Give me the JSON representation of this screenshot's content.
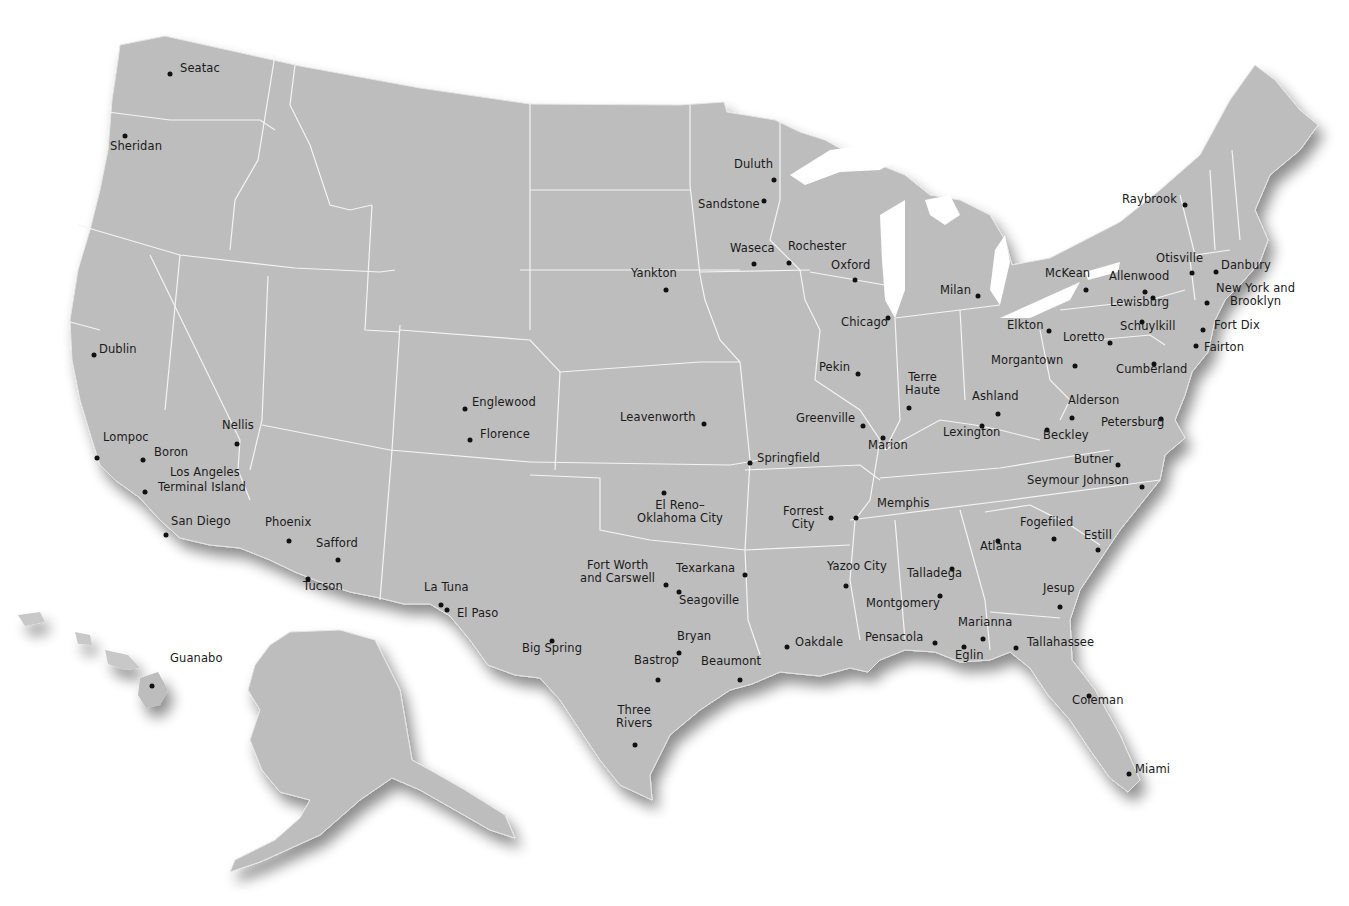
{
  "map": {
    "land_color": "#bdbdbd",
    "border_color": "#f2f2f2",
    "marker_color": "#111111",
    "label_color": "#1a1a1a",
    "background": "#ffffff"
  },
  "facilities": [
    {
      "name": "Seatac",
      "dot": [
        170,
        74
      ],
      "label": [
        180,
        68
      ]
    },
    {
      "name": "Sheridan",
      "dot": [
        125,
        136
      ],
      "label": [
        110,
        146
      ]
    },
    {
      "name": "Dublin",
      "dot": [
        94,
        355
      ],
      "label": [
        99,
        349
      ]
    },
    {
      "name": "Lompoc",
      "dot": [
        97,
        458
      ],
      "label": [
        103,
        437
      ]
    },
    {
      "name": "Boron",
      "dot": [
        143,
        460
      ],
      "label": [
        154,
        452
      ]
    },
    {
      "name": "Los Angeles",
      "dot": [
        145,
        492
      ],
      "label": [
        170,
        472
      ]
    },
    {
      "name": "Terminal Island",
      "dot": [
        145,
        492
      ],
      "label": [
        158,
        487
      ]
    },
    {
      "name": "Nellis",
      "dot": [
        237,
        444
      ],
      "label": [
        222,
        425
      ]
    },
    {
      "name": "San Diego",
      "dot": [
        166,
        535
      ],
      "label": [
        171,
        521
      ]
    },
    {
      "name": "Phoenix",
      "dot": [
        289,
        541
      ],
      "label": [
        265,
        522
      ]
    },
    {
      "name": "Safford",
      "dot": [
        338,
        560
      ],
      "label": [
        316,
        543
      ]
    },
    {
      "name": "Tucson",
      "dot": [
        308,
        579
      ],
      "label": [
        303,
        586
      ]
    },
    {
      "name": "Guanabo",
      "dot": [
        152,
        686
      ],
      "label": [
        170,
        658
      ]
    },
    {
      "name": "La Tuna",
      "dot": [
        441,
        605
      ],
      "label": [
        424,
        587
      ]
    },
    {
      "name": "El Paso",
      "dot": [
        447,
        610
      ],
      "label": [
        457,
        613
      ]
    },
    {
      "name": "Englewood",
      "dot": [
        465,
        409
      ],
      "label": [
        472,
        402
      ]
    },
    {
      "name": "Florence",
      "dot": [
        470,
        440
      ],
      "label": [
        480,
        434
      ]
    },
    {
      "name": "Leavenworth",
      "dot": [
        704,
        424
      ],
      "label": [
        620,
        417
      ]
    },
    {
      "name": "Springfield",
      "dot": [
        750,
        463
      ],
      "label": [
        757,
        458
      ]
    },
    {
      "name": "El Reno–Oklahoma City",
      "dot": [
        664,
        493
      ],
      "label": [
        637,
        505
      ]
    },
    {
      "name": "Fort Worth and Carswell",
      "dot": [
        666,
        585
      ],
      "label": [
        580,
        565
      ]
    },
    {
      "name": "Texarkana",
      "dot": [
        745,
        575
      ],
      "label": [
        676,
        568
      ]
    },
    {
      "name": "Seagoville",
      "dot": [
        679,
        592
      ],
      "label": [
        679,
        600
      ]
    },
    {
      "name": "Big Spring",
      "dot": [
        552,
        641
      ],
      "label": [
        522,
        648
      ]
    },
    {
      "name": "Bryan",
      "dot": [
        679,
        653
      ],
      "label": [
        677,
        636
      ]
    },
    {
      "name": "Bastrop",
      "dot": [
        658,
        680
      ],
      "label": [
        634,
        660
      ]
    },
    {
      "name": "Beaumont",
      "dot": [
        740,
        680
      ],
      "label": [
        701,
        661
      ]
    },
    {
      "name": "Three Rivers",
      "dot": [
        635,
        745
      ],
      "label": [
        616,
        710
      ]
    },
    {
      "name": "Oakdale",
      "dot": [
        787,
        647
      ],
      "label": [
        795,
        642
      ]
    },
    {
      "name": "Duluth",
      "dot": [
        774,
        180
      ],
      "label": [
        734,
        164
      ]
    },
    {
      "name": "Sandstone",
      "dot": [
        764,
        201
      ],
      "label": [
        698,
        204
      ]
    },
    {
      "name": "Waseca",
      "dot": [
        754,
        264
      ],
      "label": [
        730,
        248
      ]
    },
    {
      "name": "Rochester",
      "dot": [
        789,
        263
      ],
      "label": [
        788,
        246
      ]
    },
    {
      "name": "Oxford",
      "dot": [
        855,
        280
      ],
      "label": [
        831,
        265
      ]
    },
    {
      "name": "Yankton",
      "dot": [
        666,
        290
      ],
      "label": [
        631,
        273
      ]
    },
    {
      "name": "Chicago",
      "dot": [
        888,
        318
      ],
      "label": [
        841,
        322
      ]
    },
    {
      "name": "Milan",
      "dot": [
        978,
        296
      ],
      "label": [
        940,
        290
      ]
    },
    {
      "name": "Pekin",
      "dot": [
        858,
        374
      ],
      "label": [
        819,
        367
      ]
    },
    {
      "name": "Terre Haute",
      "dot": [
        909,
        408
      ],
      "label": [
        905,
        377
      ]
    },
    {
      "name": "Greenville",
      "dot": [
        863,
        426
      ],
      "label": [
        796,
        418
      ]
    },
    {
      "name": "Marion",
      "dot": [
        883,
        438
      ],
      "label": [
        868,
        445
      ]
    },
    {
      "name": "Ashland",
      "dot": [
        998,
        414
      ],
      "label": [
        972,
        396
      ]
    },
    {
      "name": "Lexington",
      "dot": [
        982,
        426
      ],
      "label": [
        943,
        432
      ]
    },
    {
      "name": "Memphis",
      "dot": [
        856,
        518
      ],
      "label": [
        877,
        503
      ]
    },
    {
      "name": "Forrest City",
      "dot": [
        831,
        518
      ],
      "label": [
        783,
        511
      ]
    },
    {
      "name": "Yazoo City",
      "dot": [
        846,
        586
      ],
      "label": [
        827,
        566
      ]
    },
    {
      "name": "Talladega",
      "dot": [
        952,
        569
      ],
      "label": [
        907,
        573
      ]
    },
    {
      "name": "Montgomery",
      "dot": [
        940,
        596
      ],
      "label": [
        866,
        603
      ]
    },
    {
      "name": "Atlanta",
      "dot": [
        998,
        541
      ],
      "label": [
        980,
        546
      ]
    },
    {
      "name": "Fogefiled",
      "dot": [
        1054,
        539
      ],
      "label": [
        1020,
        522
      ]
    },
    {
      "name": "Estill",
      "dot": [
        1098,
        550
      ],
      "label": [
        1084,
        535
      ]
    },
    {
      "name": "Jesup",
      "dot": [
        1060,
        607
      ],
      "label": [
        1043,
        588
      ]
    },
    {
      "name": "Pensacola",
      "dot": [
        935,
        643
      ],
      "label": [
        865,
        637
      ]
    },
    {
      "name": "Marianna",
      "dot": [
        983,
        639
      ],
      "label": [
        958,
        622
      ]
    },
    {
      "name": "Eglin",
      "dot": [
        964,
        647
      ],
      "label": [
        955,
        655
      ]
    },
    {
      "name": "Tallahassee",
      "dot": [
        1016,
        648
      ],
      "label": [
        1027,
        642
      ]
    },
    {
      "name": "Coleman",
      "dot": [
        1089,
        696
      ],
      "label": [
        1072,
        700
      ]
    },
    {
      "name": "Miami",
      "dot": [
        1129,
        774
      ],
      "label": [
        1135,
        769
      ]
    },
    {
      "name": "Butner",
      "dot": [
        1118,
        465
      ],
      "label": [
        1074,
        459
      ]
    },
    {
      "name": "Seymour Johnson",
      "dot": [
        1142,
        487
      ],
      "label": [
        1027,
        480
      ]
    },
    {
      "name": "Elkton",
      "dot": [
        1049,
        331
      ],
      "label": [
        1007,
        325
      ]
    },
    {
      "name": "Loretto",
      "dot": [
        1110,
        343
      ],
      "label": [
        1063,
        337
      ]
    },
    {
      "name": "Morgantown",
      "dot": [
        1075,
        366
      ],
      "label": [
        991,
        360
      ]
    },
    {
      "name": "Alderson",
      "dot": [
        1072,
        418
      ],
      "label": [
        1068,
        400
      ]
    },
    {
      "name": "Beckley",
      "dot": [
        1047,
        430
      ],
      "label": [
        1043,
        435
      ]
    },
    {
      "name": "Petersburg",
      "dot": [
        1161,
        419
      ],
      "label": [
        1101,
        422
      ]
    },
    {
      "name": "Cumberland",
      "dot": [
        1154,
        364
      ],
      "label": [
        1116,
        369
      ]
    },
    {
      "name": "Schuylkill",
      "dot": [
        1142,
        322
      ],
      "label": [
        1120,
        326
      ]
    },
    {
      "name": "Lewisburg",
      "dot": [
        1153,
        298
      ],
      "label": [
        1110,
        302
      ]
    },
    {
      "name": "Allenwood",
      "dot": [
        1145,
        292
      ],
      "label": [
        1109,
        276
      ]
    },
    {
      "name": "McKean",
      "dot": [
        1086,
        290
      ],
      "label": [
        1045,
        273
      ]
    },
    {
      "name": "Otisville",
      "dot": [
        1192,
        273
      ],
      "label": [
        1156,
        258
      ]
    },
    {
      "name": "Danbury",
      "dot": [
        1216,
        272
      ],
      "label": [
        1221,
        265
      ]
    },
    {
      "name": "New York and Brooklyn",
      "dot": [
        1207,
        303
      ],
      "label": [
        1216,
        288
      ]
    },
    {
      "name": "Fort Dix",
      "dot": [
        1203,
        330
      ],
      "label": [
        1214,
        325
      ]
    },
    {
      "name": "Fairton",
      "dot": [
        1196,
        346
      ],
      "label": [
        1204,
        347
      ]
    },
    {
      "name": "Raybrook",
      "dot": [
        1185,
        205
      ],
      "label": [
        1122,
        199
      ]
    }
  ],
  "labels_multiline": {
    "Terre Haute": [
      "Terre",
      "Haute"
    ],
    "El Reno–Oklahoma City": [
      "El Reno–",
      "Oklahoma City"
    ],
    "Fort Worth and Carswell": [
      "Fort Worth",
      "and Carswell"
    ],
    "Forrest City": [
      "Forrest",
      "City"
    ],
    "Three Rivers": [
      "Three",
      "Rivers"
    ],
    "New York and Brooklyn": [
      "New York and",
      "Brooklyn"
    ]
  }
}
